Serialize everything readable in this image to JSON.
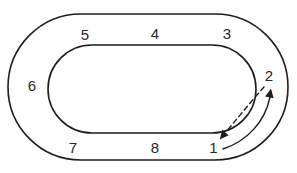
{
  "figure": {
    "type": "oval-track-position-diagram",
    "positions": [
      {
        "id": 1,
        "label": "1",
        "location": "bottom-right"
      },
      {
        "id": 2,
        "label": "2",
        "location": "right"
      },
      {
        "id": 3,
        "label": "3",
        "location": "top-right"
      },
      {
        "id": 4,
        "label": "4",
        "location": "top-center"
      },
      {
        "id": 5,
        "label": "5",
        "location": "top-left"
      },
      {
        "id": 6,
        "label": "6",
        "location": "left"
      },
      {
        "id": 7,
        "label": "7",
        "location": "bottom-left"
      },
      {
        "id": 8,
        "label": "8",
        "location": "bottom-center"
      }
    ],
    "arrows": [
      {
        "name": "solid-arrow",
        "line_style": "solid",
        "from_position": "1",
        "to_position": "2"
      },
      {
        "name": "dashed-arrow",
        "line_style": "dashed",
        "from_position": "2",
        "to_position": "1"
      }
    ],
    "colors": {
      "line": "#1e1e1e",
      "label": "#272727",
      "background": "#ffffff"
    }
  }
}
